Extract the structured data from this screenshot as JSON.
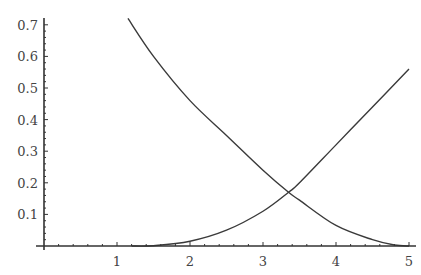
{
  "chart_data": {
    "type": "line",
    "title": "",
    "xlabel": "",
    "ylabel": "",
    "xlim": [
      0,
      5.05
    ],
    "ylim": [
      0,
      0.72
    ],
    "grid": false,
    "legend": null,
    "x_ticks": [
      1,
      2,
      3,
      4,
      5
    ],
    "x_tick_labels": [
      "1",
      "2",
      "3",
      "4",
      "5"
    ],
    "y_ticks": [
      0.1,
      0.2,
      0.3,
      0.4,
      0.5,
      0.6,
      0.7
    ],
    "y_tick_labels": [
      "0.1",
      "0.2",
      "0.3",
      "0.4",
      "0.5",
      "0.6",
      "0.7"
    ],
    "series": [
      {
        "name": "decreasing",
        "x": [
          1.15,
          1.5,
          2.0,
          2.5,
          3.0,
          3.35,
          3.5,
          4.0,
          4.5,
          4.8,
          5.0
        ],
        "y": [
          0.72,
          0.6,
          0.46,
          0.35,
          0.24,
          0.17,
          0.145,
          0.065,
          0.02,
          0.003,
          0.0
        ]
      },
      {
        "name": "increasing",
        "x": [
          1.2,
          1.5,
          2.0,
          2.5,
          3.0,
          3.35,
          3.5,
          4.0,
          4.5,
          5.0
        ],
        "y": [
          0.0,
          0.001,
          0.015,
          0.05,
          0.11,
          0.17,
          0.2,
          0.32,
          0.44,
          0.56
        ]
      }
    ]
  },
  "footer": {
    "text": ""
  }
}
